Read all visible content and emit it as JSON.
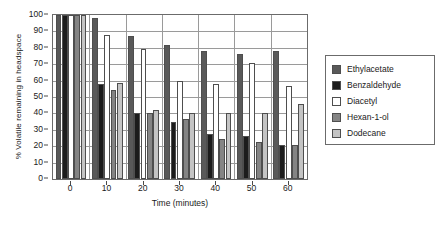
{
  "chart_data": {
    "type": "bar",
    "title": "",
    "xlabel": "Time (minutes)",
    "ylabel": "% Volatile remaining in headspace",
    "categories": [
      "0",
      "10",
      "20",
      "30",
      "40",
      "50",
      "60"
    ],
    "ylim": [
      0,
      100
    ],
    "yticks": [
      0,
      10,
      20,
      30,
      40,
      50,
      60,
      70,
      80,
      90,
      100
    ],
    "grid": true,
    "legend_position": "right",
    "series": [
      {
        "name": "Ethylacetate",
        "color": "#595959",
        "values": [
          100,
          98,
          87,
          82,
          78,
          76.5,
          78
        ]
      },
      {
        "name": "Benzaldehyde",
        "color": "#1c1c1c",
        "values": [
          100,
          58,
          40.5,
          34.5,
          27.5,
          26,
          20.5
        ]
      },
      {
        "name": "Diacetyl",
        "color": "#ffffff",
        "values": [
          100,
          88,
          79,
          60,
          58,
          70.5,
          56.5
        ]
      },
      {
        "name": "Hexan-1-ol",
        "color": "#848484",
        "values": [
          100,
          54,
          40,
          36.5,
          24.5,
          22.5,
          20.5
        ]
      },
      {
        "name": "Dodecane",
        "color": "#c4c4c4",
        "values": [
          100,
          58.5,
          42,
          40.5,
          40.5,
          40.5,
          46
        ]
      }
    ]
  },
  "legend": {
    "items": [
      {
        "label": "Ethylacetate"
      },
      {
        "label": "Benzaldehyde"
      },
      {
        "label": "Diacetyl"
      },
      {
        "label": "Hexan-1-ol"
      },
      {
        "label": "Dodecane"
      }
    ]
  },
  "axes": {
    "y_title": "% Volatile remaining in headspace",
    "x_title": "Time (minutes)",
    "y_tick_labels": [
      "0",
      "10",
      "20",
      "30",
      "40",
      "50",
      "60",
      "70",
      "80",
      "90",
      "100"
    ],
    "x_tick_labels": [
      "0",
      "10",
      "20",
      "30",
      "40",
      "50",
      "60"
    ]
  }
}
